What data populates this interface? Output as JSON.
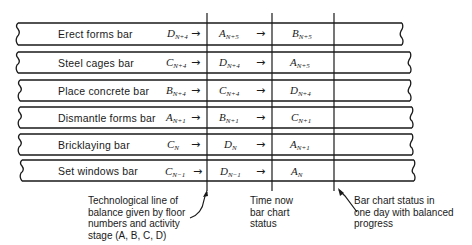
{
  "diagram": {
    "bars": [
      {
        "label": "Erect forms bar",
        "cells": [
          {
            "letter": "D",
            "sub": "N+4"
          },
          {
            "letter": "A",
            "sub": "N+5"
          },
          {
            "letter": "B",
            "sub": "N+5"
          }
        ]
      },
      {
        "label": "Steel cages bar",
        "cells": [
          {
            "letter": "C",
            "sub": "N+4"
          },
          {
            "letter": "D",
            "sub": "N+4"
          },
          {
            "letter": "A",
            "sub": "N+5"
          }
        ]
      },
      {
        "label": "Place concrete bar",
        "cells": [
          {
            "letter": "B",
            "sub": "N+4"
          },
          {
            "letter": "C",
            "sub": "N+4"
          },
          {
            "letter": "D",
            "sub": "N+4"
          }
        ]
      },
      {
        "label": "Dismantle forms bar",
        "cells": [
          {
            "letter": "A",
            "sub": "N+1"
          },
          {
            "letter": "B",
            "sub": "N+1"
          },
          {
            "letter": "C",
            "sub": "N+1"
          }
        ]
      },
      {
        "label": "Bricklaying bar",
        "cells": [
          {
            "letter": "C",
            "sub": "N"
          },
          {
            "letter": "D",
            "sub": "N"
          },
          {
            "letter": "A",
            "sub": "N+1"
          }
        ]
      },
      {
        "label": "Set windows bar",
        "cells": [
          {
            "letter": "C",
            "sub": "N−1"
          },
          {
            "letter": "D",
            "sub": "N−1"
          },
          {
            "letter": "A",
            "sub": "N"
          }
        ]
      }
    ],
    "arrow_glyph": "→",
    "annotations": {
      "line_of_balance": [
        "Technological line of",
        "balance given by floor",
        "numbers and activity",
        "stage (A, B, C, D)"
      ],
      "time_now": [
        "Time now",
        "bar chart",
        "status"
      ],
      "one_day": [
        "Bar chart status in",
        "one day with balanced",
        "progress"
      ]
    }
  }
}
